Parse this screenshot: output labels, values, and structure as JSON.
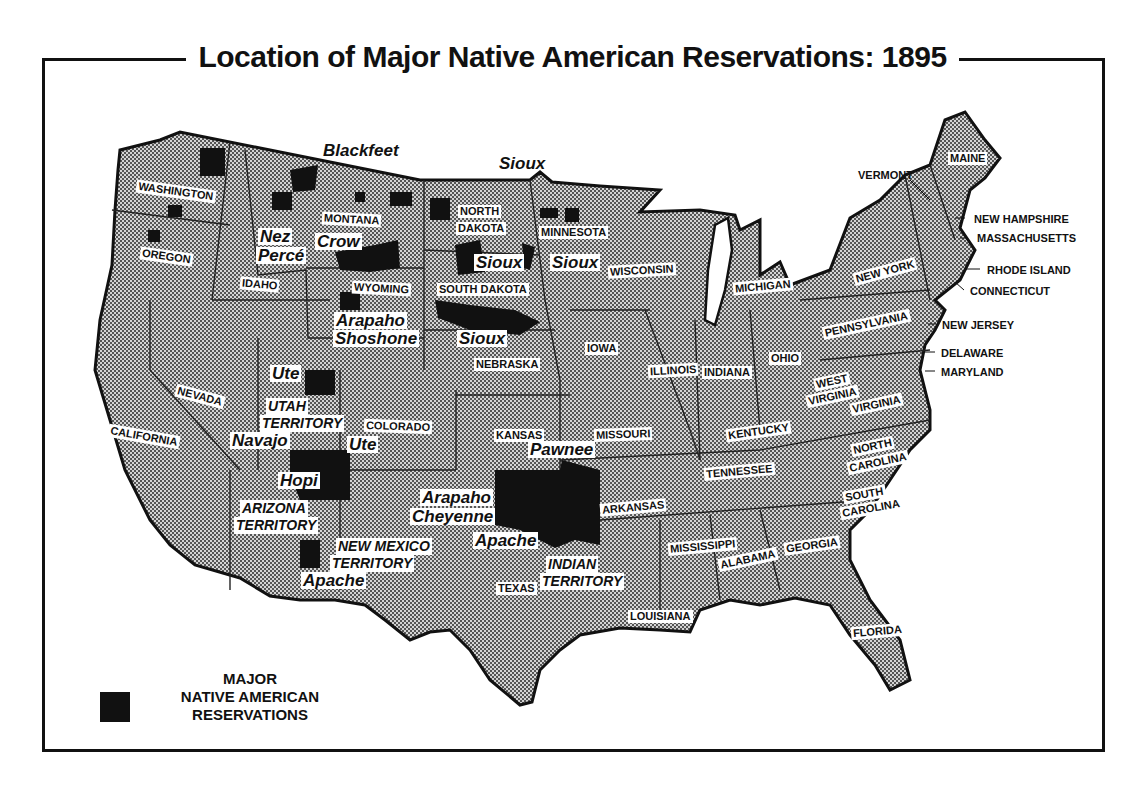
{
  "title": "Location of Major Native American Reservations: 1895",
  "colors": {
    "land_fill": "#b9b9b9",
    "reservation": "#111111",
    "border": "#111111",
    "background": "#ffffff"
  },
  "legend": {
    "line1": "MAJOR",
    "line2": "NATIVE AMERICAN",
    "line3": "RESERVATIONS",
    "swatch": "reservation-black-square"
  },
  "states": [
    {
      "name": "WASHINGTON",
      "x": 136,
      "y": 185,
      "rot": 8
    },
    {
      "name": "OREGON",
      "x": 140,
      "y": 250,
      "rot": 8
    },
    {
      "name": "IDAHO",
      "x": 240,
      "y": 278,
      "rot": 5
    },
    {
      "name": "MONTANA",
      "x": 322,
      "y": 213,
      "rot": 3
    },
    {
      "name": "WYOMING",
      "x": 352,
      "y": 282,
      "rot": 3
    },
    {
      "name": "NORTH",
      "x": 458,
      "y": 205,
      "rot": 0
    },
    {
      "name": "DAKOTA",
      "x": 456,
      "y": 222,
      "rot": 0
    },
    {
      "name": "SOUTH DAKOTA",
      "x": 437,
      "y": 283,
      "rot": 0
    },
    {
      "name": "MINNESOTA",
      "x": 539,
      "y": 226,
      "rot": 0
    },
    {
      "name": "WISCONSIN",
      "x": 608,
      "y": 264,
      "rot": -3
    },
    {
      "name": "MICHIGAN",
      "x": 733,
      "y": 280,
      "rot": -5
    },
    {
      "name": "NEBRASKA",
      "x": 474,
      "y": 358,
      "rot": 0
    },
    {
      "name": "IOWA",
      "x": 585,
      "y": 342,
      "rot": 0
    },
    {
      "name": "ILLINOIS",
      "x": 648,
      "y": 364,
      "rot": -3
    },
    {
      "name": "INDIANA",
      "x": 702,
      "y": 366,
      "rot": 0
    },
    {
      "name": "OHIO",
      "x": 769,
      "y": 352,
      "rot": 0
    },
    {
      "name": "PENNSYLVANIA",
      "x": 822,
      "y": 318,
      "rot": -12
    },
    {
      "name": "NEW YORK",
      "x": 853,
      "y": 265,
      "rot": -15
    },
    {
      "name": "NEVADA",
      "x": 175,
      "y": 390,
      "rot": 15
    },
    {
      "name": "CALIFORNIA",
      "x": 108,
      "y": 430,
      "rot": 10
    },
    {
      "name": "UTAH",
      "x": 270,
      "y": 400,
      "rot": 0
    },
    {
      "name": "TERRITORY",
      "x": 252,
      "y": 418,
      "rot": 5
    },
    {
      "name": "COLORADO",
      "x": 364,
      "y": 420,
      "rot": 2
    },
    {
      "name": "KANSAS",
      "x": 494,
      "y": 429,
      "rot": 0
    },
    {
      "name": "MISSOURI",
      "x": 594,
      "y": 428,
      "rot": -2
    },
    {
      "name": "KENTUCKY",
      "x": 726,
      "y": 425,
      "rot": -8
    },
    {
      "name": "WEST",
      "x": 814,
      "y": 375,
      "rot": -12
    },
    {
      "name": "VIRGINIA",
      "x": 806,
      "y": 390,
      "rot": -12
    },
    {
      "name": "VIRGINIA",
      "x": 850,
      "y": 398,
      "rot": -12
    },
    {
      "name": "NORTH",
      "x": 851,
      "y": 440,
      "rot": -12
    },
    {
      "name": "CAROLINA",
      "x": 847,
      "y": 456,
      "rot": -12
    },
    {
      "name": "TENNESSEE",
      "x": 704,
      "y": 465,
      "rot": -5
    },
    {
      "name": "ARKANSAS",
      "x": 600,
      "y": 501,
      "rot": -5
    },
    {
      "name": "SOUTH",
      "x": 843,
      "y": 488,
      "rot": -10
    },
    {
      "name": "CAROLINA",
      "x": 840,
      "y": 502,
      "rot": -10
    },
    {
      "name": "MISSISSIPPI",
      "x": 668,
      "y": 540,
      "rot": -5
    },
    {
      "name": "ALABAMA",
      "x": 718,
      "y": 553,
      "rot": -12
    },
    {
      "name": "GEORGIA",
      "x": 784,
      "y": 539,
      "rot": -8
    },
    {
      "name": "TEXAS",
      "x": 496,
      "y": 582,
      "rot": 0
    },
    {
      "name": "LOUISIANA",
      "x": 628,
      "y": 610,
      "rot": 0
    },
    {
      "name": "FLORIDA",
      "x": 851,
      "y": 625,
      "rot": -5
    },
    {
      "name": "MAINE",
      "x": 948,
      "y": 152,
      "rot": 0
    }
  ],
  "territories": [
    {
      "line1": "UTAH",
      "line2": "TERRITORY",
      "x": 266,
      "y": 398
    },
    {
      "line1": "ARIZONA",
      "line2": "TERRITORY",
      "x": 240,
      "y": 500
    },
    {
      "line1": "NEW MEXICO",
      "line2": "TERRITORY",
      "x": 336,
      "y": 538
    },
    {
      "line1": "INDIAN",
      "line2": "TERRITORY",
      "x": 546,
      "y": 556
    }
  ],
  "callouts": [
    {
      "name": "VERMONT",
      "x": 856,
      "y": 169
    },
    {
      "name": "NEW HAMPSHIRE",
      "x": 972,
      "y": 213
    },
    {
      "name": "MASSACHUSETTS",
      "x": 975,
      "y": 232
    },
    {
      "name": "RHODE ISLAND",
      "x": 985,
      "y": 264
    },
    {
      "name": "CONNECTICUT",
      "x": 968,
      "y": 285
    },
    {
      "name": "NEW JERSEY",
      "x": 940,
      "y": 319
    },
    {
      "name": "DELAWARE",
      "x": 939,
      "y": 347
    },
    {
      "name": "MARYLAND",
      "x": 939,
      "y": 366
    }
  ],
  "tribes": [
    {
      "name": "Blackfeet",
      "x": 321,
      "y": 142,
      "bg": false
    },
    {
      "name": "Sioux",
      "x": 497,
      "y": 155,
      "bg": false
    },
    {
      "name": "Nez",
      "x": 258,
      "y": 228,
      "bg": true
    },
    {
      "name": "Percé",
      "x": 256,
      "y": 247,
      "bg": true
    },
    {
      "name": "Crow",
      "x": 315,
      "y": 233,
      "bg": true
    },
    {
      "name": "Sioux",
      "x": 474,
      "y": 254,
      "bg": true
    },
    {
      "name": "Sioux",
      "x": 550,
      "y": 254,
      "bg": true
    },
    {
      "name": "Arapaho",
      "x": 334,
      "y": 312,
      "bg": true
    },
    {
      "name": "Shoshone",
      "x": 333,
      "y": 330,
      "bg": true
    },
    {
      "name": "Sioux",
      "x": 457,
      "y": 330,
      "bg": true
    },
    {
      "name": "Ute",
      "x": 270,
      "y": 365,
      "bg": true
    },
    {
      "name": "Navajo",
      "x": 230,
      "y": 432,
      "bg": true
    },
    {
      "name": "Ute",
      "x": 347,
      "y": 436,
      "bg": true
    },
    {
      "name": "Hopi",
      "x": 278,
      "y": 472,
      "bg": true
    },
    {
      "name": "Apache",
      "x": 301,
      "y": 572,
      "bg": true
    },
    {
      "name": "Arapaho",
      "x": 420,
      "y": 489,
      "bg": true
    },
    {
      "name": "Cheyenne",
      "x": 410,
      "y": 508,
      "bg": true
    },
    {
      "name": "Pawnee",
      "x": 528,
      "y": 441,
      "bg": true
    },
    {
      "name": "Apache",
      "x": 473,
      "y": 532,
      "bg": true
    }
  ]
}
